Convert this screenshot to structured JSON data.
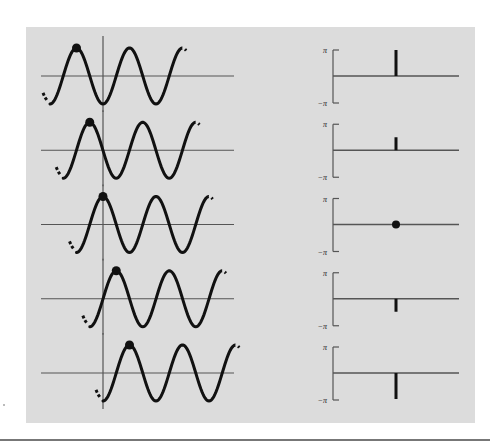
{
  "figure": {
    "panel_color": "#dcdcdc",
    "ink_color": "#111111",
    "axis_color": "#555555",
    "phase_axis_labels": {
      "top": "π",
      "bottom": "−π"
    },
    "rows": [
      {
        "index": 1,
        "phase_label": "π",
        "phase_value": 3.1416,
        "stem": "full-up"
      },
      {
        "index": 2,
        "phase_label": "π/2",
        "phase_value": 1.5708,
        "stem": "half-up"
      },
      {
        "index": 3,
        "phase_label": "0",
        "phase_value": 0,
        "stem": "dot"
      },
      {
        "index": 4,
        "phase_label": "−π/2",
        "phase_value": -1.5708,
        "stem": "half-down"
      },
      {
        "index": 5,
        "phase_label": "−π",
        "phase_value": -3.1416,
        "stem": "full-down"
      }
    ]
  }
}
